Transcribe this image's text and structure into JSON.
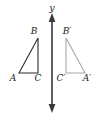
{
  "figure": {
    "background_color": "#ffffff",
    "width": 104,
    "height": 116
  },
  "axis": {
    "name": "y-axis",
    "label": "y",
    "orientation": "vertical",
    "color": "#3a3a3a",
    "x_position": 52,
    "top_y": 14,
    "bottom_y": 112,
    "arrow_top": true,
    "arrow_bottom": true,
    "label_x": 52,
    "label_y": 11
  },
  "shapes": [
    {
      "name": "triangle-abc",
      "kind": "preimage",
      "stroke_color": "#2b2b2b",
      "stroke_width": 1.1,
      "fill": "none",
      "points": "19,73 38,38 38,73",
      "vertices": [
        {
          "label": "A",
          "x": 19,
          "y": 73,
          "label_x": 13,
          "label_y": 81
        },
        {
          "label": "B",
          "x": 38,
          "y": 38,
          "label_x": 34,
          "label_y": 34
        },
        {
          "label": "C",
          "x": 38,
          "y": 73,
          "label_x": 37,
          "label_y": 81
        }
      ]
    },
    {
      "name": "triangle-a-prime-b-prime-c-prime",
      "kind": "image",
      "stroke_color": "#a8a8a8",
      "stroke_width": 1.1,
      "fill": "none",
      "points": "85,73 66,38 66,73",
      "vertices": [
        {
          "label": "A′",
          "x": 85,
          "y": 73,
          "label_x": 85,
          "label_y": 81
        },
        {
          "label": "B′",
          "x": 66,
          "y": 38,
          "label_x": 65,
          "label_y": 34
        },
        {
          "label": "C′",
          "x": 66,
          "y": 73,
          "label_x": 59,
          "label_y": 81
        }
      ]
    }
  ],
  "labels": {
    "A": "A",
    "B": "B",
    "C": "C",
    "A_prime": "A′",
    "B_prime": "B′",
    "C_prime": "C′",
    "y": "y"
  }
}
